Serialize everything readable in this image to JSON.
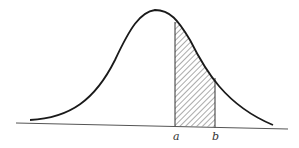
{
  "diagram": {
    "type": "normal-distribution-curve",
    "labels": {
      "a": "a",
      "b": "b"
    },
    "shaded_region": {
      "from": "a",
      "to": "b",
      "fill": "diagonal-hatch"
    },
    "colors": {
      "curve": "#1a1a1a",
      "axis": "#555555",
      "hatch": "#444444",
      "background": "#ffffff"
    }
  }
}
